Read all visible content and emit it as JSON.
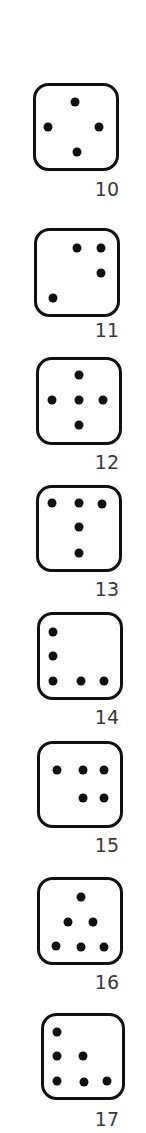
{
  "colors": {
    "background": "#ffffff",
    "outline": "#111111",
    "pip": "#111111",
    "label": "#3a3a3a"
  },
  "dice": [
    {
      "label": "10",
      "box": {
        "x": 33,
        "y": 83,
        "w": 86,
        "h": 88
      },
      "label_top": 180,
      "pips": [
        [
          75,
          102
        ],
        [
          48,
          127
        ],
        [
          99,
          127
        ],
        [
          77,
          152
        ]
      ]
    },
    {
      "label": "11",
      "box": {
        "x": 34,
        "y": 228,
        "w": 86,
        "h": 89
      },
      "label_top": 321,
      "pips": [
        [
          77,
          248
        ],
        [
          101,
          248
        ],
        [
          101,
          273
        ],
        [
          53,
          298
        ]
      ]
    },
    {
      "label": "12",
      "box": {
        "x": 36,
        "y": 357,
        "w": 86,
        "h": 88
      },
      "label_top": 453,
      "pips": [
        [
          79,
          375
        ],
        [
          52,
          400
        ],
        [
          79,
          400
        ],
        [
          103,
          400
        ],
        [
          79,
          425
        ]
      ]
    },
    {
      "label": "13",
      "box": {
        "x": 36,
        "y": 485,
        "w": 86,
        "h": 87
      },
      "label_top": 580,
      "pips": [
        [
          52,
          503
        ],
        [
          79,
          503
        ],
        [
          102,
          504
        ],
        [
          79,
          527
        ],
        [
          79,
          553
        ]
      ]
    },
    {
      "label": "14",
      "box": {
        "x": 37,
        "y": 612,
        "w": 86,
        "h": 88
      },
      "label_top": 708,
      "pips": [
        [
          53,
          632
        ],
        [
          53,
          656
        ],
        [
          53,
          681
        ],
        [
          81,
          681
        ],
        [
          104,
          681
        ]
      ]
    },
    {
      "label": "15",
      "box": {
        "x": 37,
        "y": 741,
        "w": 86,
        "h": 87
      },
      "label_top": 836,
      "pips": [
        [
          57,
          770
        ],
        [
          83,
          770
        ],
        [
          104,
          770
        ],
        [
          83,
          798
        ],
        [
          104,
          798
        ]
      ]
    },
    {
      "label": "16",
      "box": {
        "x": 37,
        "y": 877,
        "w": 86,
        "h": 88
      },
      "label_top": 973,
      "pips": [
        [
          81,
          897
        ],
        [
          68,
          922
        ],
        [
          93,
          922
        ],
        [
          56,
          946
        ],
        [
          81,
          947
        ],
        [
          104,
          947
        ]
      ]
    },
    {
      "label": "17",
      "box": {
        "x": 41,
        "y": 1013,
        "w": 84,
        "h": 87
      },
      "label_top": 1110,
      "pips": [
        [
          57,
          1032
        ],
        [
          57,
          1056
        ],
        [
          83,
          1056
        ],
        [
          57,
          1081
        ],
        [
          84,
          1082
        ],
        [
          107,
          1081
        ]
      ]
    }
  ]
}
